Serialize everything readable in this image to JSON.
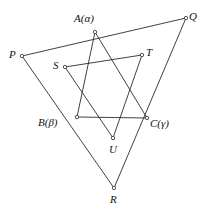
{
  "figure": {
    "type": "geometry-diagram",
    "title": "",
    "stroke_color": "#2b2b2b",
    "vertex_fill": "#ffffff",
    "background": "#ffffff",
    "labels": {
      "A": "A(α)",
      "B": "B(β)",
      "C": "C(γ)",
      "P": "P",
      "Q": "Q",
      "R": "R",
      "S": "S",
      "T": "T",
      "U": "U"
    },
    "points": [
      {
        "id": "A",
        "label": "A(α)",
        "x": 95,
        "y": 32,
        "label_x": 74,
        "label_y": 13
      },
      {
        "id": "B",
        "label": "B(β)",
        "x": 77,
        "y": 117,
        "label_x": 38,
        "label_y": 117
      },
      {
        "id": "C",
        "label": "C(γ)",
        "x": 147,
        "y": 118,
        "label_x": 150,
        "label_y": 118
      },
      {
        "id": "P",
        "label": "P",
        "x": 22,
        "y": 56,
        "label_x": 9,
        "label_y": 49
      },
      {
        "id": "Q",
        "label": "Q",
        "x": 186,
        "y": 18,
        "label_x": 189,
        "label_y": 11
      },
      {
        "id": "R",
        "label": "R",
        "x": 114,
        "y": 188,
        "label_x": 110,
        "label_y": 194
      },
      {
        "id": "S",
        "label": "S",
        "x": 65,
        "y": 67,
        "label_x": 53,
        "label_y": 60
      },
      {
        "id": "T",
        "label": "T",
        "x": 142,
        "y": 55,
        "label_x": 146,
        "label_y": 47
      },
      {
        "id": "U",
        "label": "U",
        "x": 113,
        "y": 138,
        "label_x": 109,
        "label_y": 144
      }
    ],
    "segments": [
      {
        "name": "outer-edge-PQ",
        "from": "P",
        "to": "Q"
      },
      {
        "name": "outer-edge-PR",
        "from": "P",
        "to": "R"
      },
      {
        "name": "outer-edge-QR",
        "from": "Q",
        "to": "R"
      },
      {
        "name": "triangle-ABC-edge-AB",
        "from": "A",
        "to": "B"
      },
      {
        "name": "triangle-ABC-edge-BC",
        "from": "B",
        "to": "C"
      },
      {
        "name": "triangle-ABC-edge-CA",
        "from": "C",
        "to": "A"
      },
      {
        "name": "triangle-STU-edge-ST",
        "from": "S",
        "to": "T"
      },
      {
        "name": "triangle-STU-edge-TU",
        "from": "T",
        "to": "U"
      },
      {
        "name": "triangle-STU-edge-US",
        "from": "U",
        "to": "S"
      }
    ],
    "notes": {
      "inscribed": "A on PQ, B on PR, C on QR",
      "star": "Triangles ABC and STU overlap forming a hexagram"
    }
  }
}
